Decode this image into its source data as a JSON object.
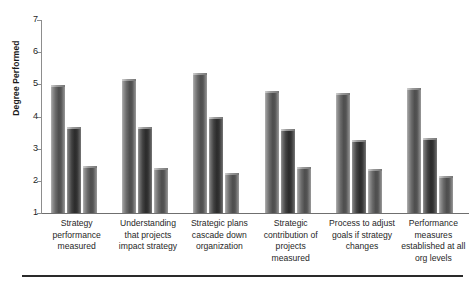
{
  "chart_data": {
    "type": "bar",
    "title": "",
    "subtitle": "",
    "xlabel": "",
    "ylabel": "Degree Performed",
    "ylim": [
      1,
      7
    ],
    "yticks": [
      1,
      2,
      3,
      4,
      5,
      6,
      7
    ],
    "ytick_labels": [
      "1",
      "2",
      "3",
      "4",
      "5",
      "6",
      "7"
    ],
    "grid": false,
    "legend": "none",
    "categories": [
      "Strategy performance measured",
      "Understanding that projects impact strategy",
      "Strategic plans cascade down organization",
      "Strategic contribution of projects measured",
      "Process to adjust goals if strategy changes",
      "Performance measures established at all org levels"
    ],
    "category_lines": [
      [
        "Strategy",
        "performance",
        "measured"
      ],
      [
        "Understanding",
        "that projects",
        "impact strategy"
      ],
      [
        "Strategic plans",
        "cascade down",
        "organization"
      ],
      [
        "Strategic",
        "contribution of",
        "projects",
        "measured"
      ],
      [
        "Process to adjust",
        "goals if strategy",
        "changes"
      ],
      [
        "Performance",
        "measures",
        "established at all",
        "org levels"
      ]
    ],
    "series": [
      {
        "name": "Series 1",
        "values": [
          4.98,
          5.18,
          5.35,
          4.78,
          4.72,
          4.88
        ]
      },
      {
        "name": "Series 2",
        "values": [
          3.68,
          3.68,
          3.98,
          3.6,
          3.26,
          3.32
        ]
      },
      {
        "name": "Series 3",
        "values": [
          2.46,
          2.4,
          2.24,
          2.42,
          2.36,
          2.14
        ]
      }
    ],
    "colors": {
      "series1": "#6a6a6a",
      "series2": "#3a3a3a",
      "series3": "#5a5a5a",
      "axis": "#7d7d7d",
      "text": "#1f1f1f"
    }
  }
}
